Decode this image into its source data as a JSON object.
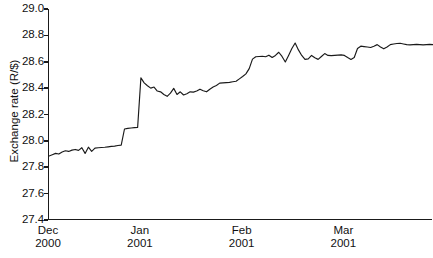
{
  "chart_data": {
    "type": "line",
    "title": "",
    "xlabel": "",
    "ylabel": "Exchange rate (R/$)",
    "ylim": [
      27.4,
      29.0
    ],
    "ytick_labels": [
      "29.0",
      "28.8",
      "28.6",
      "28.4",
      "28.2",
      "28.0",
      "27.8",
      "27.6",
      "27.4"
    ],
    "ytick_values": [
      29.0,
      28.8,
      28.6,
      28.4,
      28.2,
      28.0,
      27.8,
      27.6,
      27.4
    ],
    "xtick_labels": [
      {
        "line1": "Dec",
        "line2": "2000"
      },
      {
        "line1": "Jan",
        "line2": "2001"
      },
      {
        "line1": "Feb",
        "line2": "2001"
      },
      {
        "line1": "Mar",
        "line2": "2001"
      }
    ],
    "xtick_positions": [
      0,
      28,
      59,
      90
    ],
    "x": [
      0,
      1,
      2,
      3,
      4,
      5,
      6,
      7,
      8,
      9,
      10,
      11,
      12,
      13,
      14,
      15,
      16,
      17,
      18,
      19,
      20,
      21,
      22,
      23,
      24,
      25,
      26,
      27,
      28,
      29,
      30,
      31,
      32,
      33,
      34,
      35,
      36,
      37,
      38,
      39,
      40,
      41,
      42,
      43,
      44,
      45,
      46,
      47,
      48,
      49,
      50,
      51,
      52,
      53,
      54,
      55,
      56,
      57,
      58,
      59,
      60,
      61,
      62,
      63,
      64,
      65,
      66,
      67,
      68,
      69,
      70,
      71,
      72,
      73,
      74,
      75,
      76,
      77,
      78,
      79,
      80,
      81,
      82,
      83,
      84,
      85,
      86,
      87,
      88,
      89,
      90,
      91,
      92,
      93,
      94,
      95,
      96,
      97,
      98,
      99,
      100,
      101,
      102,
      103,
      104,
      105,
      106,
      107,
      108,
      109,
      110,
      111,
      112,
      113,
      114,
      115,
      116,
      117
    ],
    "values": [
      27.885,
      27.895,
      27.905,
      27.9,
      27.915,
      27.925,
      27.92,
      27.93,
      27.935,
      27.928,
      27.948,
      27.905,
      27.952,
      27.92,
      27.945,
      27.948,
      27.95,
      27.952,
      27.955,
      27.958,
      27.96,
      27.965,
      27.968,
      28.09,
      28.095,
      28.098,
      28.1,
      28.102,
      28.478,
      28.44,
      28.418,
      28.4,
      28.408,
      28.378,
      28.372,
      28.352,
      28.338,
      28.362,
      28.398,
      28.352,
      28.372,
      28.348,
      28.358,
      28.372,
      28.37,
      28.378,
      28.392,
      28.38,
      28.372,
      28.392,
      28.408,
      28.42,
      28.438,
      28.44,
      28.442,
      28.444,
      28.448,
      28.452,
      28.47,
      28.488,
      28.508,
      28.548,
      28.62,
      28.638,
      28.64,
      28.642,
      28.638,
      28.65,
      28.632,
      28.648,
      28.672,
      28.64,
      28.598,
      28.648,
      28.7,
      28.742,
      28.69,
      28.648,
      28.618,
      28.622,
      28.648,
      28.63,
      28.618,
      28.64,
      28.662,
      28.648,
      28.646,
      28.648,
      28.65,
      28.652,
      28.648,
      28.632,
      28.618,
      28.632,
      28.7,
      28.718,
      28.715,
      28.712,
      28.708,
      28.718,
      28.73,
      28.712,
      28.698,
      28.712,
      28.73,
      28.735,
      28.738,
      28.74,
      28.735,
      28.73,
      28.728,
      28.73,
      28.732,
      28.73,
      28.728,
      28.73,
      28.732,
      28.73
    ],
    "grid": false,
    "legend": false,
    "line_color": "#1a1a1a"
  }
}
